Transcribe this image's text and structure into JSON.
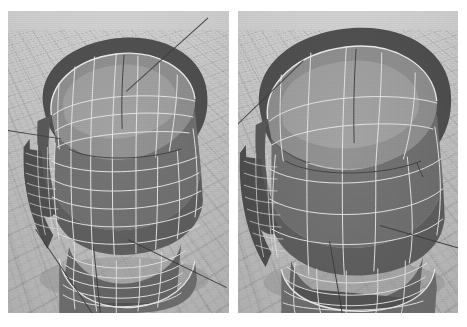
{
  "figure": {
    "background_color": "#ffffff",
    "viewport_background_color": "#c9c9c7",
    "wireframe_color": "#e8e8e6",
    "axis_line_color": "#3a3a3a",
    "panel_count": 2
  },
  "panels": [
    {
      "id": "left-viewport",
      "label": "Left viewport",
      "caption": "Dense quad mesh",
      "mesh_density": "high",
      "view": "three-quarter from above, subject facing left",
      "shading": "flat-shaded faces with white wireframe",
      "surface_tones": {
        "cap": "#8f8f8f",
        "front": "#6e6e6e",
        "side": "#585858",
        "neck": "#656565"
      },
      "axis_lines": 4,
      "ground_grid": true
    },
    {
      "id": "right-viewport",
      "label": "Right viewport",
      "caption": "Coarse quad mesh",
      "mesh_density": "low",
      "view": "three-quarter from above, subject facing left",
      "shading": "flat-shaded faces with white wireframe",
      "surface_tones": {
        "cap": "#8f8f8f",
        "front": "#6e6e6e",
        "side": "#585858",
        "neck": "#656565"
      },
      "axis_lines": 3,
      "ground_grid": true
    }
  ]
}
